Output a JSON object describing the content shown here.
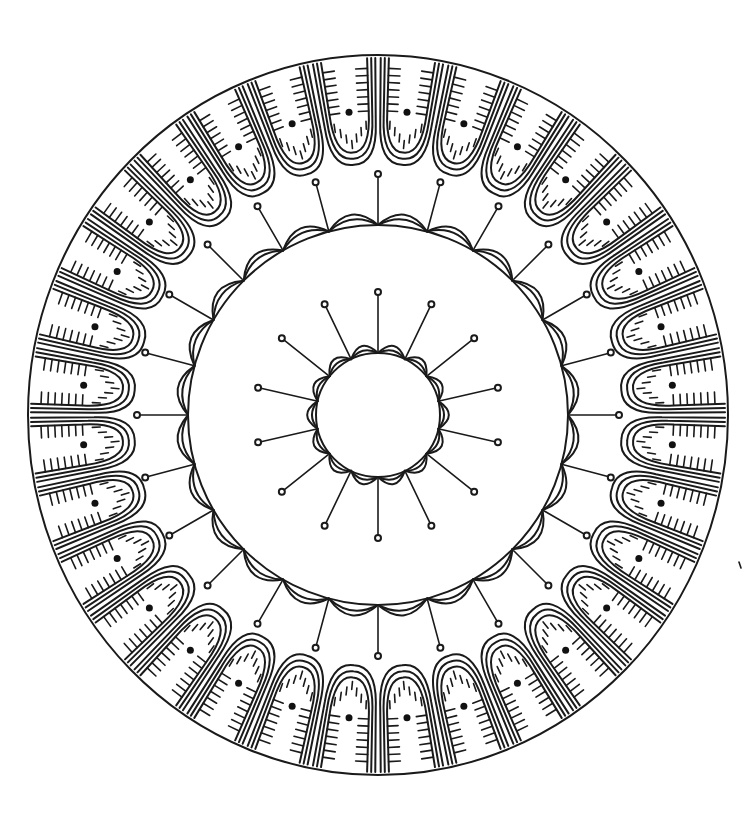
{
  "artwork": {
    "title": "Mandala coloring page",
    "style": "black line art on white",
    "colors": {
      "line": "#1a1a1a",
      "background": "#ffffff",
      "dot": "#111111"
    },
    "center": [
      378,
      415
    ],
    "outer_ring": {
      "rx": 350,
      "ry": 360,
      "petal_count": 32,
      "petal_style": "U-shaped triple outline with tick marks and center dot"
    },
    "middle_ring": {
      "radius": 190,
      "scallop_count": 24,
      "spoke_count": 24,
      "spoke_style": "line ending in small open circle"
    },
    "inner_ring": {
      "radius": 62,
      "scallop_count": 14,
      "spoke_count": 14,
      "spoke_style": "line ending in small open circle"
    }
  }
}
